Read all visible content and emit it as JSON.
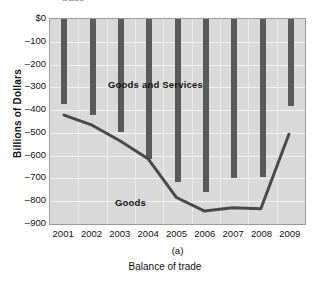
{
  "figure": {
    "top_partial_text": "trade",
    "sub_caption": "(a)",
    "caption": "Balance of trade",
    "y_axis_title": "Billions of Dollars"
  },
  "colors": {
    "plot_background": "#d9d9d9",
    "gridline": "#f2f2f2",
    "bar": "#5a5a5a",
    "line": "#4a4a4a",
    "text": "#111111",
    "frame": "#9a9a9a"
  },
  "chart_data": {
    "type": "bar",
    "title": "Balance of trade",
    "xlabel": "",
    "ylabel": "Billions of Dollars",
    "categories": [
      "2001",
      "2002",
      "2003",
      "2004",
      "2005",
      "2006",
      "2007",
      "2008",
      "2009"
    ],
    "ylim": [
      -900,
      0
    ],
    "yticks": [
      0,
      -100,
      -200,
      -300,
      -400,
      -500,
      -600,
      -700,
      -800,
      -900
    ],
    "ytick_labels": [
      "$0",
      "–100",
      "–200",
      "–300",
      "–400",
      "–500",
      "–600",
      "–700",
      "–800",
      "–900"
    ],
    "grid": true,
    "legend": "in-plot labels",
    "series": [
      {
        "name": "Goods and Services",
        "render": "bar",
        "values": [
          -375,
          -420,
          -495,
          -615,
          -715,
          -760,
          -700,
          -695,
          -380
        ]
      },
      {
        "name": "Goods",
        "render": "line",
        "values": [
          -425,
          -470,
          -540,
          -620,
          -790,
          -850,
          -835,
          -840,
          -510
        ]
      }
    ],
    "annotations": [
      {
        "text": "Goods and Services",
        "x": "2002",
        "y": -230
      },
      {
        "text": "Goods",
        "x": "2004",
        "y": -730
      }
    ]
  }
}
